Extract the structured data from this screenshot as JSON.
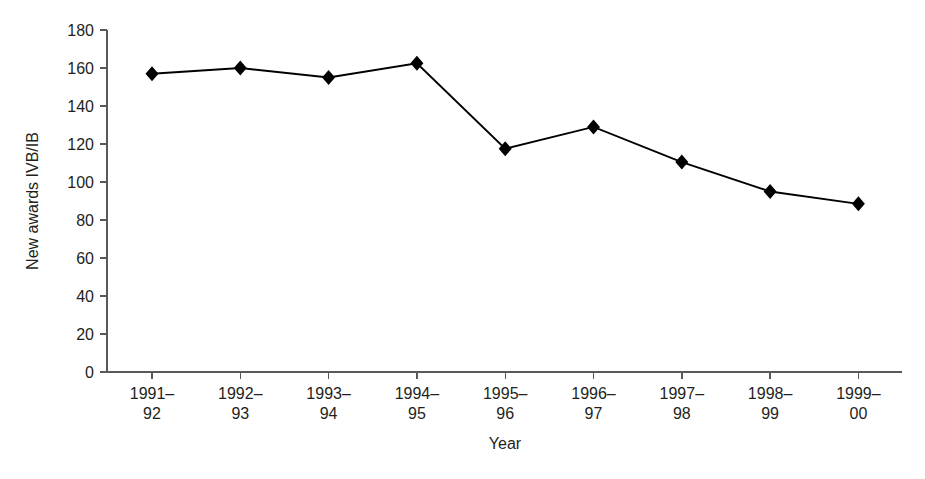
{
  "chart_data": {
    "type": "line",
    "title": "",
    "xlabel": "Year",
    "ylabel": "New awards IVB/IB",
    "categories": [
      "1991–\n92",
      "1992–\n93",
      "1993–\n94",
      "1994–\n95",
      "1995–\n96",
      "1996–\n97",
      "1997–\n98",
      "1998–\n99",
      "1999–\n00"
    ],
    "category_lines": [
      [
        "1991–",
        "92"
      ],
      [
        "1992–",
        "93"
      ],
      [
        "1993–",
        "94"
      ],
      [
        "1994–",
        "95"
      ],
      [
        "1995–",
        "96"
      ],
      [
        "1996–",
        "97"
      ],
      [
        "1997–",
        "98"
      ],
      [
        "1998–",
        "99"
      ],
      [
        "1999–",
        "00"
      ]
    ],
    "values": [
      157,
      160,
      155,
      162.5,
      117.5,
      129,
      110.5,
      95,
      88.5
    ],
    "ylim": [
      0,
      180
    ],
    "ytick_values": [
      0,
      20,
      40,
      60,
      80,
      100,
      120,
      140,
      160,
      180
    ],
    "ytick_labels": [
      "0",
      "20",
      "40",
      "60",
      "80",
      "100",
      "120",
      "140",
      "160",
      "180"
    ],
    "grid": false,
    "legend": false,
    "marker": "diamond",
    "series_color": "#000000",
    "axis_color": "#58595b",
    "background": "#ffffff"
  },
  "axes": {
    "y_title": "New awards IVB/IB",
    "x_title": "Year"
  }
}
